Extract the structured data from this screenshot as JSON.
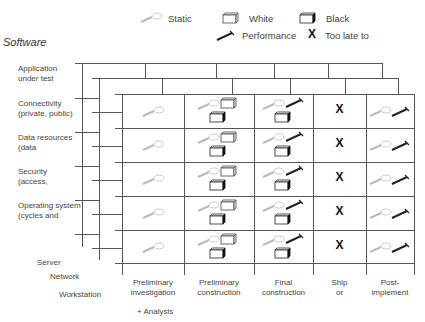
{
  "title": "Software",
  "legend": [
    {
      "icon": "magnifier-icon",
      "label": "Static"
    },
    {
      "icon": "white-box-icon",
      "label": "White"
    },
    {
      "icon": "black-box-icon",
      "label": "Black"
    },
    {
      "icon": "hammer-icon",
      "label": "Performance"
    },
    {
      "icon": "x-mark-icon",
      "label": "Too late to"
    }
  ],
  "layers": {
    "software_rows": [
      {
        "line1": "Application",
        "line2": "under test"
      },
      {
        "line1": "Connectivity",
        "line2": "(private, public)"
      },
      {
        "line1": "Data resources",
        "line2": "(data"
      },
      {
        "line1": "Security",
        "line2": "(access,"
      },
      {
        "line1": "Operating system",
        "line2": "(cycles and"
      }
    ],
    "depth_labels": [
      "Server",
      "Network",
      "Workstation"
    ]
  },
  "phases": [
    {
      "line1": "Preliminary",
      "line2": "investigation"
    },
    {
      "line1": "Preliminary",
      "line2": "construction"
    },
    {
      "line1": "Final",
      "line2": "construction"
    },
    {
      "line1": "Ship",
      "line2": "or"
    },
    {
      "line1": "Post-",
      "line2": "implement"
    }
  ],
  "footnote": "+ Analysis",
  "cell_contents": [
    [
      "static"
    ],
    [
      "static",
      "white",
      "black"
    ],
    [
      "static",
      "performance",
      "black"
    ],
    [
      "x"
    ],
    [
      "static",
      "performance"
    ]
  ],
  "row_count": 5,
  "x_symbol": "X"
}
